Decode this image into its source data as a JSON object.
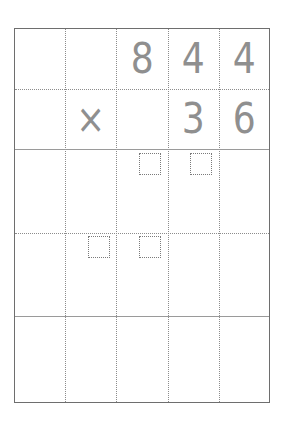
{
  "worksheet": {
    "type": "long-multiplication-grid",
    "columns": 5,
    "rows": 5,
    "multiplicand": {
      "digits": [
        "",
        "",
        "8",
        "4",
        "4"
      ]
    },
    "operator_row": {
      "operator": "×",
      "digits": [
        "",
        "",
        "",
        "3",
        "6"
      ]
    },
    "carry_boxes": [
      {
        "row": 3,
        "col": 3
      },
      {
        "row": 3,
        "col": 4
      },
      {
        "row": 4,
        "col": 2
      },
      {
        "row": 4,
        "col": 3
      }
    ],
    "colors": {
      "border": "#6e6e6e",
      "grid_lines": "#8c8c8c",
      "digits": "#8f8f8f"
    }
  }
}
